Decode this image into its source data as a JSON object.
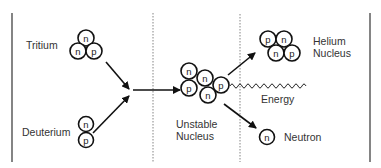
{
  "diagram": {
    "colors": {
      "ink": "#111111",
      "text": "#333333",
      "background": "#ffffff"
    },
    "dividers": [
      {
        "x": 12,
        "style": "solid"
      },
      {
        "x": 153,
        "style": "dotted"
      },
      {
        "x": 240,
        "style": "dotted"
      },
      {
        "x": 370,
        "style": "solid"
      }
    ],
    "labels": {
      "tritium": "Tritium",
      "deuterium": "Deuterium",
      "unstable_line1": "Unstable",
      "unstable_line2": "Nucleus",
      "helium_line1": "Helium",
      "helium_line2": "Nucleus",
      "energy": "Energy",
      "neutron": "Neutron"
    },
    "particles": {
      "neutron_symbol": "n",
      "proton_symbol": "p"
    },
    "nuclei": {
      "tritium": [
        "n",
        "n",
        "p"
      ],
      "deuterium": [
        "n",
        "p"
      ],
      "unstable": [
        "n",
        "n",
        "p",
        "n",
        "p"
      ],
      "helium": [
        "p",
        "n",
        "n",
        "p"
      ],
      "free_neutron": [
        "n"
      ]
    }
  }
}
